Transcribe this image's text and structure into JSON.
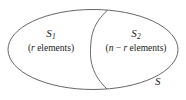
{
  "figure": {
    "type": "venn-partition-diagram",
    "stroke_color": "#555555",
    "text_color": "#1a1a1a",
    "background_color": "#ffffff"
  },
  "universe": {
    "label": "S"
  },
  "regions": [
    {
      "id": "left",
      "name": "S",
      "subscript": "1",
      "count_open": "(",
      "count_var": "r",
      "count_text": " elements)",
      "count_full": "(r elements)"
    },
    {
      "id": "right",
      "name": "S",
      "subscript": "2",
      "count_open": "(",
      "count_var_1": "n",
      "count_operator": " − ",
      "count_var_2": "r",
      "count_text": " elements)",
      "count_full": "(n − r elements)"
    }
  ]
}
